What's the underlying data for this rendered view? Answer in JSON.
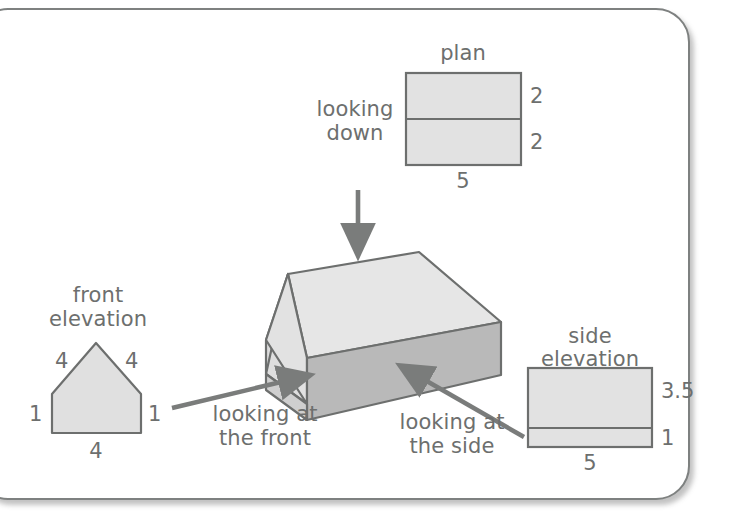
{
  "diagram": {
    "title_alt": "orthographic projections of a house",
    "stroke_color": "#6d6f6e",
    "fill_light": "#e4e4e4",
    "fill_mid": "#d9d9d9",
    "fill_dark": "#b9b9b9",
    "arrow_color": "#7a7c7b",
    "panel_border": "#7e8180"
  },
  "plan": {
    "title": "plan",
    "label_top_right": "2",
    "label_bottom_right": "2",
    "label_bottom": "5"
  },
  "front_elevation": {
    "title_line1": "front",
    "title_line2": "elevation",
    "label_roof_left": "4",
    "label_roof_right": "4",
    "label_wall_left": "1",
    "label_wall_right": "1",
    "label_base": "4"
  },
  "side_elevation": {
    "title_line1": "side",
    "title_line2": "elevation",
    "label_top_right": "3.5",
    "label_bottom_right": "1",
    "label_bottom": "5"
  },
  "annotations": {
    "looking_down_line1": "looking",
    "looking_down_line2": "down",
    "looking_front_line1": "looking at",
    "looking_front_line2": "the front",
    "looking_side_line1": "looking at",
    "looking_side_line2": "the side"
  }
}
